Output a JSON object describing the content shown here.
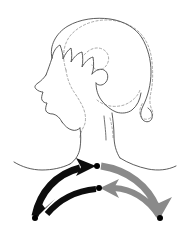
{
  "figure": {
    "title": "Cervical rotation range of motion diagram",
    "background_color": "#ffffff",
    "outline_color": "#4a4a4a",
    "dashed_outline_color": "#9a9a9a"
  },
  "anatomy": {
    "solid_head": {
      "name": "head-neutral-outline",
      "style": "solid",
      "color": "#4a4a4a",
      "view": "left profile with hair"
    },
    "dashed_head": {
      "name": "head-rotated-outline",
      "style": "dashed",
      "color": "#9a9a9a",
      "view": "rotated position overlay"
    },
    "neck": {
      "name": "neck-outline",
      "color": "#4a4a4a"
    },
    "shoulders": {
      "name": "shoulders-outline",
      "color": "#4a4a4a"
    }
  },
  "arrows": {
    "left_rotation": {
      "name": "left-rotation-arrows",
      "color": "#0d0d0d",
      "direction": "left",
      "count": 2,
      "upper": {
        "name": "arrow-left-outward",
        "start_point": [
          34,
          218
        ],
        "end_point": [
          95,
          165
        ],
        "head_direction": "right"
      },
      "lower": {
        "name": "arrow-left-return",
        "start_point": [
          95,
          188
        ],
        "end_point": [
          36,
          216
        ],
        "head_direction": "down-left"
      }
    },
    "right_rotation": {
      "name": "right-rotation-arrows",
      "color": "#8a8a8a",
      "direction": "right",
      "count": 2,
      "upper": {
        "name": "arrow-right-outward",
        "start_point": [
          101,
          165
        ],
        "end_point": [
          160,
          216
        ],
        "head_direction": "down-right"
      },
      "lower": {
        "name": "arrow-right-return",
        "start_point": [
          160,
          218
        ],
        "end_point": [
          102,
          188
        ],
        "head_direction": "left"
      }
    },
    "pivots": [
      {
        "name": "pivot-dot-upper",
        "x": 98,
        "y": 165
      },
      {
        "name": "pivot-dot-lower",
        "x": 99,
        "y": 188
      },
      {
        "name": "pivot-dot-left",
        "x": 34,
        "y": 218
      },
      {
        "name": "pivot-dot-right",
        "x": 160,
        "y": 218
      }
    ]
  },
  "colors": {
    "black": "#0d0d0d",
    "gray": "#8a8a8a",
    "outline": "#4a4a4a",
    "dashed": "#9a9a9a",
    "background": "#ffffff"
  }
}
